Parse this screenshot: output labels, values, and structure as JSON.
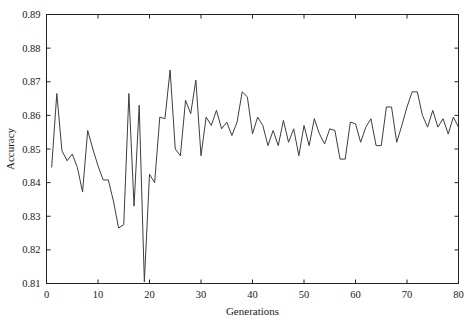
{
  "chart_data": {
    "type": "line",
    "title": "",
    "xlabel": "Generations",
    "ylabel": "Accuracy",
    "xlim": [
      0,
      80
    ],
    "ylim": [
      0.81,
      0.89
    ],
    "xticks": [
      0,
      10,
      20,
      30,
      40,
      50,
      60,
      70,
      80
    ],
    "xtick_labels": [
      "0",
      "10",
      "20",
      "30",
      "40",
      "50",
      "60",
      "70",
      "80"
    ],
    "yticks": [
      0.81,
      0.82,
      0.83,
      0.84,
      0.85,
      0.86,
      0.87,
      0.88,
      0.89
    ],
    "ytick_labels": [
      "0.81",
      "0.82",
      "0.83",
      "0.84",
      "0.85",
      "0.86",
      "0.87",
      "0.88",
      "0.89"
    ],
    "grid": false,
    "legend": null,
    "line_color": "#3d3d3d",
    "series": [
      {
        "name": "Accuracy",
        "x": [
          1,
          2,
          3,
          4,
          5,
          6,
          7,
          8,
          9,
          10,
          11,
          12,
          13,
          14,
          15,
          16,
          17,
          18,
          19,
          20,
          21,
          22,
          23,
          24,
          25,
          26,
          27,
          28,
          29,
          30,
          31,
          32,
          33,
          34,
          35,
          36,
          37,
          38,
          39,
          40,
          41,
          42,
          43,
          44,
          45,
          46,
          47,
          48,
          49,
          50,
          51,
          52,
          53,
          54,
          55,
          56,
          57,
          58,
          59,
          60,
          61,
          62,
          63,
          64,
          65,
          66,
          67,
          68,
          69,
          70,
          71,
          72,
          73,
          74,
          75,
          76,
          77,
          78,
          79,
          80
        ],
        "values": [
          0.8445,
          0.8665,
          0.8495,
          0.8465,
          0.8485,
          0.8445,
          0.8372,
          0.8555,
          0.85,
          0.845,
          0.8408,
          0.8408,
          0.8345,
          0.8265,
          0.8275,
          0.8665,
          0.833,
          0.863,
          0.8105,
          0.8425,
          0.84,
          0.8595,
          0.859,
          0.8735,
          0.85,
          0.848,
          0.8645,
          0.8605,
          0.8705,
          0.848,
          0.8595,
          0.857,
          0.8615,
          0.856,
          0.858,
          0.854,
          0.858,
          0.867,
          0.8655,
          0.8545,
          0.8595,
          0.857,
          0.851,
          0.8555,
          0.851,
          0.8585,
          0.852,
          0.856,
          0.848,
          0.857,
          0.851,
          0.859,
          0.8545,
          0.8515,
          0.856,
          0.8555,
          0.847,
          0.847,
          0.858,
          0.8575,
          0.852,
          0.8565,
          0.859,
          0.851,
          0.851,
          0.8625,
          0.8625,
          0.852,
          0.857,
          0.8625,
          0.867,
          0.867,
          0.86,
          0.8565,
          0.8615,
          0.8565,
          0.859,
          0.8545,
          0.8595,
          0.8565
        ]
      }
    ]
  }
}
